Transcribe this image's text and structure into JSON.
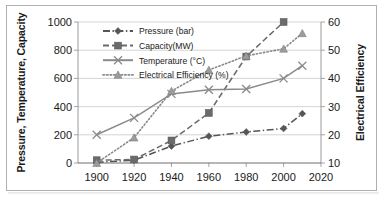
{
  "chart_data": {
    "type": "line",
    "title": "",
    "xlabel": "",
    "ylabel": "Pressure, Temperature, Capacity",
    "y2label": "Electrical Efficiency",
    "x": [
      1900,
      1920,
      1940,
      1960,
      1980,
      2000,
      2010
    ],
    "xlim": [
      1890,
      2020
    ],
    "xticks": [
      1900,
      1920,
      1940,
      1960,
      1980,
      2000,
      2020
    ],
    "ylim": [
      0,
      1000
    ],
    "yticks": [
      0,
      200,
      400,
      600,
      800,
      1000
    ],
    "y2lim": [
      10,
      60
    ],
    "y2ticks": [
      10,
      20,
      30,
      40,
      50,
      60
    ],
    "grid": true,
    "legend_position": "top-center",
    "series": [
      {
        "name": "Pressure (bar)",
        "axis": "left",
        "linestyle": "dash-dot",
        "marker": "diamond",
        "color": "#555555",
        "x": [
          1900,
          1920,
          1940,
          1960,
          1980,
          2000,
          2010
        ],
        "values": [
          5,
          20,
          120,
          190,
          220,
          245,
          350
        ]
      },
      {
        "name": "Capacity(MW)",
        "axis": "left",
        "linestyle": "dashed",
        "marker": "square",
        "color": "#6b6b6b",
        "x": [
          1900,
          1920,
          1940,
          1960,
          1980,
          2000
        ],
        "values": [
          20,
          25,
          160,
          355,
          755,
          1000
        ]
      },
      {
        "name": "Temperature (°C)",
        "axis": "left",
        "linestyle": "solid",
        "marker": "x",
        "color": "#8a8a8a",
        "x": [
          1900,
          1920,
          1940,
          1960,
          1980,
          2000,
          2010
        ],
        "values": [
          200,
          320,
          490,
          520,
          525,
          600,
          690
        ]
      },
      {
        "name": "Electrical Efficiency (%)",
        "axis": "right",
        "linestyle": "dotted",
        "marker": "triangle",
        "color": "#8a8a8a",
        "x": [
          1900,
          1920,
          1940,
          1960,
          1980,
          2000,
          2010
        ],
        "values": [
          10,
          19,
          35.5,
          43,
          48,
          50.5,
          56
        ]
      }
    ]
  },
  "legend": {
    "items": [
      {
        "label": "Pressure (bar)"
      },
      {
        "label": "Capacity(MW)"
      },
      {
        "label": "Temperature (°C)"
      },
      {
        "label": "Electrical Efficiency (%)"
      }
    ]
  },
  "axes": {
    "left_title": "Pressure, Temperature, Capacity",
    "right_title": "Electrical Efficiency",
    "left_ticks": [
      "1000",
      "800",
      "600",
      "400",
      "200",
      "0"
    ],
    "right_ticks": [
      "60",
      "50",
      "40",
      "30",
      "20",
      "10"
    ],
    "x_ticks": [
      "1900",
      "1920",
      "1940",
      "1960",
      "1980",
      "2000",
      "2020"
    ]
  }
}
